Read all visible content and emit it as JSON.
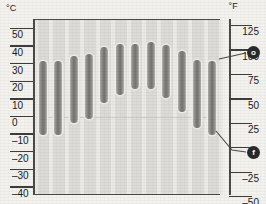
{
  "chart_data": {
    "type": "bar",
    "title": "",
    "subtitle": "",
    "xlabel": "",
    "ylabel": "Temperature",
    "left_axis": {
      "unit_label": "°C",
      "ticks": [
        50,
        40,
        30,
        20,
        10,
        0,
        -10,
        -20,
        -30,
        -40
      ],
      "tick_labels": [
        "50",
        "40",
        "30",
        "20",
        "10",
        "0",
        "–10",
        "–20",
        "–30",
        "–40"
      ],
      "ylim": [
        -45,
        55
      ]
    },
    "right_axis": {
      "unit_label": "°F",
      "ticks": [
        125,
        100,
        75,
        50,
        25,
        0,
        -25,
        -50
      ],
      "tick_labels": [
        "125",
        "100",
        "75",
        "50",
        "25",
        "0",
        "–25",
        "–50"
      ],
      "ylim": [
        -49,
        131
      ]
    },
    "grid": false,
    "legend_position": "none",
    "bar_style": "range-capsule",
    "categories": [
      "1",
      "2",
      "3",
      "4",
      "5",
      "6",
      "7",
      "8",
      "9",
      "10",
      "11",
      "12"
    ],
    "series": [
      {
        "name": "Temperature range (°C)",
        "low": [
          -11,
          -11,
          -4,
          -2,
          7,
          12,
          15,
          15,
          10,
          2,
          -7,
          -11
        ],
        "high": [
          31,
          31,
          34,
          35,
          39,
          41,
          41,
          42,
          40,
          37,
          32,
          31
        ]
      }
    ],
    "annotations": [
      {
        "id": "marker-o",
        "label": "o",
        "value_f": 85,
        "note": "upper callout on °F scale"
      },
      {
        "id": "marker-f",
        "label": "f",
        "value_f": 0,
        "note": "lower callout on °F scale"
      }
    ]
  },
  "axes": {
    "left_unit": "°C",
    "right_unit": "°F"
  },
  "badges": {
    "upper": "o",
    "lower": "f"
  }
}
